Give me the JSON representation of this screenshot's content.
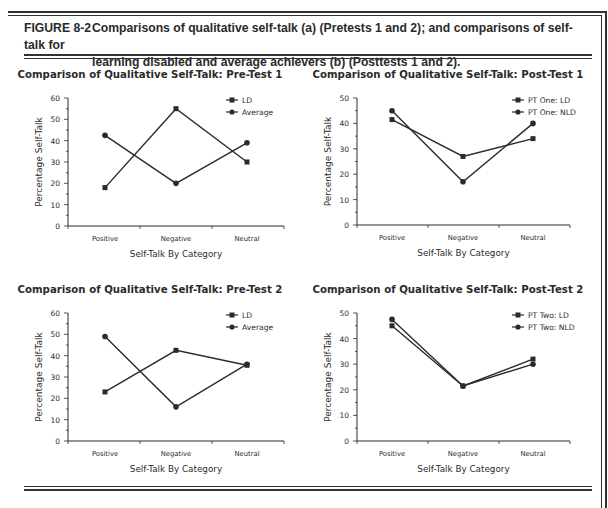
{
  "figure": {
    "label": "FIGURE 8-2",
    "caption_line1": "Comparisons of qualitative self-talk (a) (Pretests 1 and 2); and comparisons of self-talk for",
    "caption_line2": "learning disabled and average achievers (b) (Posttests 1 and 2)."
  },
  "chart_data": [
    {
      "type": "line",
      "title": "Comparison of Qualitative Self-Talk: Pre-Test 1",
      "xlabel": "Self-Talk By Category",
      "ylabel": "Percentage Self-Talk",
      "categories": [
        "Positive",
        "Negative",
        "Neutral"
      ],
      "ylim": [
        0,
        60
      ],
      "yticks": [
        0,
        10,
        20,
        30,
        40,
        50,
        60
      ],
      "series": [
        {
          "name": "LD",
          "marker": "square",
          "values": [
            18,
            55,
            30
          ]
        },
        {
          "name": "Average",
          "marker": "circle",
          "values": [
            42.5,
            20,
            39
          ]
        }
      ],
      "legend_position": "top-right",
      "grid": false
    },
    {
      "type": "line",
      "title": "Comparison of Qualitative Self-Talk: Post-Test 1",
      "xlabel": "Self-Talk By Category",
      "ylabel": "Percentage Self-Talk",
      "categories": [
        "Positive",
        "Negative",
        "Neutral"
      ],
      "ylim": [
        0,
        50
      ],
      "yticks": [
        0,
        10,
        20,
        30,
        40,
        50
      ],
      "series": [
        {
          "name": "PT One: LD",
          "marker": "square",
          "values": [
            41.5,
            27,
            34
          ]
        },
        {
          "name": "PT One: NLD",
          "marker": "circle",
          "values": [
            45,
            17,
            40
          ]
        }
      ],
      "legend_position": "top-right",
      "grid": false
    },
    {
      "type": "line",
      "title": "Comparison of Qualitative Self-Talk: Pre-Test 2",
      "xlabel": "Self-Talk By Category",
      "ylabel": "Percentage Self-Talk",
      "categories": [
        "Positive",
        "Negative",
        "Neutral"
      ],
      "ylim": [
        0,
        60
      ],
      "yticks": [
        0,
        10,
        20,
        30,
        40,
        50,
        60
      ],
      "series": [
        {
          "name": "LD",
          "marker": "square",
          "values": [
            23,
            42.5,
            35.5
          ]
        },
        {
          "name": "Average",
          "marker": "circle",
          "values": [
            49,
            16,
            36
          ]
        }
      ],
      "legend_position": "top-right",
      "grid": false
    },
    {
      "type": "line",
      "title": "Comparison of Qualitative Self-Talk: Post-Test 2",
      "xlabel": "Self-Talk By Category",
      "ylabel": "Percentage Self-Talk",
      "categories": [
        "Positive",
        "Negative",
        "Neutral"
      ],
      "ylim": [
        0,
        50
      ],
      "yticks": [
        0,
        10,
        20,
        30,
        40,
        50
      ],
      "series": [
        {
          "name": "PT Two: LD",
          "marker": "square",
          "values": [
            45,
            21.5,
            32
          ]
        },
        {
          "name": "PT Two: NLD",
          "marker": "circle",
          "values": [
            47.5,
            21.5,
            30
          ]
        }
      ],
      "legend_position": "top-right",
      "grid": false
    }
  ],
  "colors": {
    "ink": "#2b2b2b",
    "rule": "#333333",
    "background": "#ffffff"
  }
}
